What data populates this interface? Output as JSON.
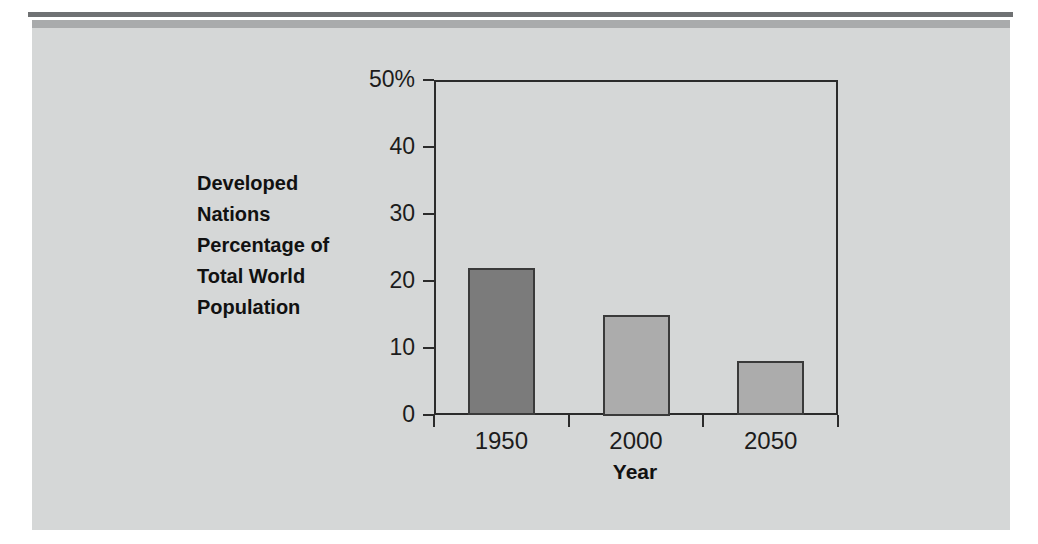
{
  "page": {
    "background_color": "#ffffff",
    "panel_color": "#d5d7d7",
    "rule_color": "#6f7173",
    "band_color": "#a9abac"
  },
  "chart_data": {
    "type": "bar",
    "title": "",
    "subtitle": "",
    "categories": [
      "1950",
      "2000",
      "2050"
    ],
    "values": [
      22,
      15,
      8
    ],
    "series": [
      {
        "name": "Developed Nations Percentage of Total World Population",
        "values": [
          22,
          15,
          8
        ]
      }
    ],
    "bar_colors": [
      "#7b7b7b",
      "#acacac",
      "#acacac"
    ],
    "bar_border_color": "#3a3a3a",
    "xlabel": "Year",
    "ylabel": "Developed Nations Percentage of Total World Population",
    "ylabel_lines": [
      "Developed",
      "Nations",
      "Percentage of",
      "Total World",
      "Population"
    ],
    "ylim": [
      0,
      50
    ],
    "yticks": [
      0,
      10,
      20,
      30,
      40,
      50
    ],
    "ytick_labels": [
      "0",
      "10",
      "20",
      "30",
      "40",
      "50%"
    ],
    "xtick_labels": [
      "1950",
      "2000",
      "2050"
    ],
    "grid": false,
    "legend": false,
    "legend_position": "none",
    "axis_color": "#2b2b2b",
    "unit": "%"
  }
}
